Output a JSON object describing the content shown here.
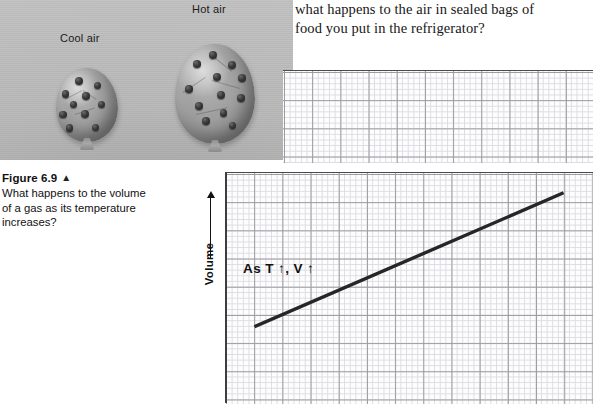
{
  "question": {
    "line1": "what happens to the air in sealed bags of",
    "line2": "food you put in the refrigerator?"
  },
  "photo": {
    "cool_label": "Cool air",
    "hot_label": "Hot air",
    "background_color": "#b5b5b5"
  },
  "caption": {
    "title": "Figure 6.9",
    "triangle": "▲",
    "line1": "What happens to the volume",
    "line2": "of a gas as its temperature",
    "line3": "increases?"
  },
  "chart_data": {
    "type": "line",
    "title": "",
    "xlabel": "",
    "ylabel": "Volume",
    "ylabel_arrow": "↑",
    "annotation": "As T ↑, V ↑",
    "grid": "on",
    "legend": "none",
    "axis_color": "#3e3e3e",
    "line_color": "#262626",
    "major_grid_color": "#9a9aa0",
    "minor_grid_color": "#dcdce2",
    "x": [
      0.08,
      0.92
    ],
    "y": [
      0.33,
      0.91
    ],
    "xlim": [
      0,
      1
    ],
    "ylim": [
      0,
      1
    ],
    "series": [
      {
        "name": "Volume vs Temperature",
        "points": [
          [
            0.08,
            0.33
          ],
          [
            0.92,
            0.91
          ]
        ]
      }
    ]
  }
}
